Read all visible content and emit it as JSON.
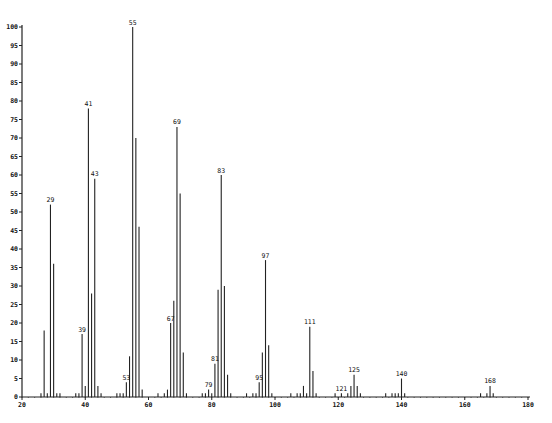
{
  "chart_data": {
    "type": "bar",
    "subtype": "mass-spectrum-stick",
    "title": "",
    "xlabel": "",
    "ylabel": "",
    "xlim": [
      20,
      180
    ],
    "ylim": [
      0,
      100
    ],
    "grid": false,
    "legend": null,
    "x_ticks": [
      20,
      40,
      60,
      80,
      100,
      120,
      140,
      160,
      180
    ],
    "y_ticks": [
      0,
      5,
      10,
      15,
      20,
      25,
      30,
      35,
      40,
      45,
      50,
      55,
      60,
      65,
      70,
      75,
      80,
      85,
      90,
      95,
      100
    ],
    "x": [
      26,
      27,
      28,
      29,
      30,
      31,
      32,
      37,
      38,
      39,
      40,
      41,
      42,
      43,
      44,
      45,
      50,
      51,
      52,
      53,
      54,
      55,
      56,
      57,
      58,
      63,
      65,
      66,
      67,
      68,
      69,
      70,
      71,
      72,
      77,
      78,
      79,
      80,
      81,
      82,
      83,
      84,
      85,
      86,
      91,
      93,
      94,
      95,
      96,
      97,
      98,
      99,
      105,
      107,
      108,
      109,
      110,
      111,
      112,
      113,
      119,
      121,
      123,
      124,
      125,
      126,
      127,
      135,
      137,
      138,
      139,
      140,
      141,
      165,
      167,
      168,
      169
    ],
    "values": [
      1,
      18,
      1,
      52,
      36,
      1,
      1,
      1,
      1,
      17,
      3,
      78,
      28,
      59,
      3,
      1,
      1,
      1,
      1,
      4,
      11,
      100,
      70,
      46,
      2,
      1,
      1,
      2,
      20,
      26,
      73,
      55,
      12,
      1,
      1,
      1,
      2,
      1,
      9,
      29,
      60,
      30,
      6,
      1,
      1,
      1,
      1,
      4,
      12,
      37,
      14,
      1,
      1,
      1,
      1,
      3,
      1,
      19,
      7,
      1,
      1,
      1,
      1,
      3,
      6,
      3,
      1,
      1,
      1,
      1,
      1,
      5,
      1,
      1,
      1,
      3,
      1
    ],
    "annotations": [
      {
        "x": 29,
        "label": "29"
      },
      {
        "x": 39,
        "label": "39"
      },
      {
        "x": 41,
        "label": "41"
      },
      {
        "x": 43,
        "label": "43"
      },
      {
        "x": 53,
        "label": "53"
      },
      {
        "x": 55,
        "label": "55"
      },
      {
        "x": 67,
        "label": "67"
      },
      {
        "x": 69,
        "label": "69"
      },
      {
        "x": 79,
        "label": "79"
      },
      {
        "x": 81,
        "label": "81"
      },
      {
        "x": 83,
        "label": "83"
      },
      {
        "x": 95,
        "label": "95"
      },
      {
        "x": 97,
        "label": "97"
      },
      {
        "x": 111,
        "label": "111"
      },
      {
        "x": 121,
        "label": "121"
      },
      {
        "x": 125,
        "label": "125"
      },
      {
        "x": 140,
        "label": "140"
      },
      {
        "x": 168,
        "label": "168"
      }
    ]
  },
  "style": {
    "line_color": "#222222",
    "background": "#ffffff"
  }
}
